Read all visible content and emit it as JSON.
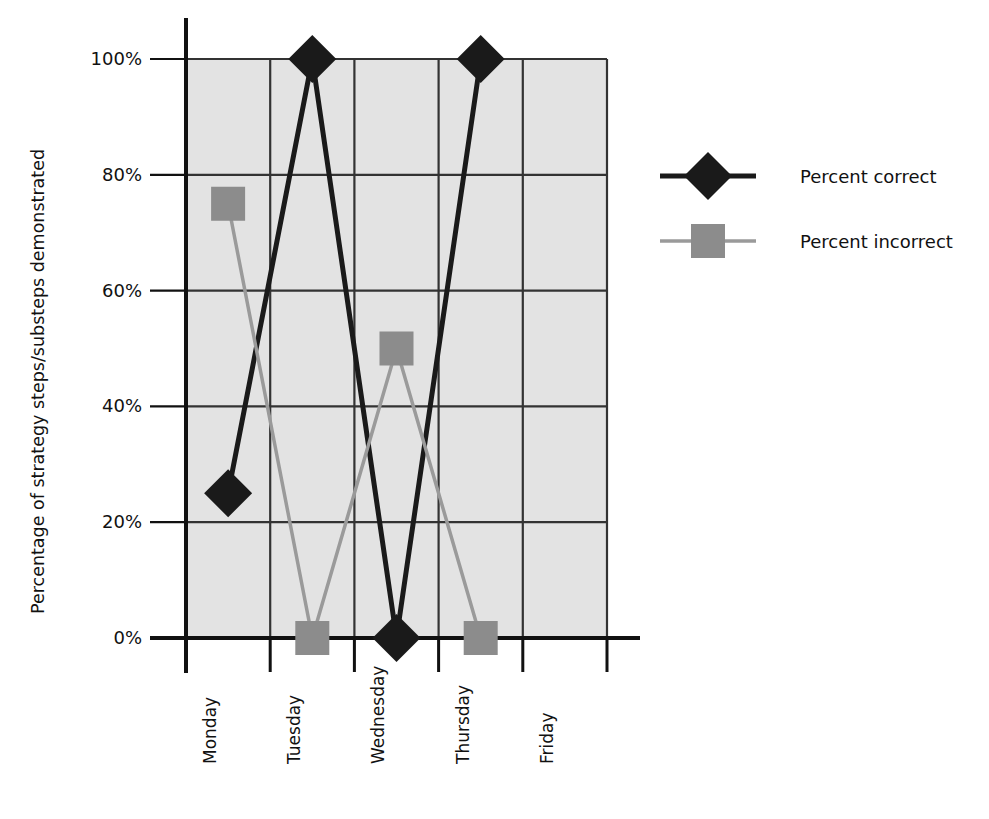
{
  "chart_data": {
    "type": "line",
    "title": "",
    "subtitle": "",
    "xlabel": "",
    "ylabel": "Percentage of strategy steps/substeps demonstrated",
    "categories": [
      "Monday",
      "Tuesday",
      "Wednesday",
      "Thursday",
      "Friday"
    ],
    "ylim": [
      0,
      100
    ],
    "yticks": [
      0,
      20,
      40,
      60,
      80,
      100
    ],
    "ytick_labels": [
      "0%",
      "20%",
      "40%",
      "60%",
      "80%",
      "100%"
    ],
    "grid": true,
    "grid_axes": "both",
    "legend_position": "right",
    "series": [
      {
        "name": "Percent correct",
        "marker": "diamond",
        "color": "#1a1a1a",
        "line_color": "#1a1a1a",
        "values": [
          25,
          100,
          0,
          100,
          null
        ]
      },
      {
        "name": "Percent incorrect",
        "marker": "square",
        "color": "#8c8c8c",
        "line_color": "#9a9a9a",
        "values": [
          75,
          0,
          50,
          0,
          null
        ]
      }
    ],
    "annotations": []
  },
  "axes": {
    "y_axis_title": "Percentage of strategy steps/substeps demonstrated",
    "y_ticks": [
      {
        "value": 100,
        "label": "100%"
      },
      {
        "value": 80,
        "label": "80%"
      },
      {
        "value": 60,
        "label": "60%"
      },
      {
        "value": 40,
        "label": "40%"
      },
      {
        "value": 20,
        "label": "20%"
      },
      {
        "value": 0,
        "label": "0%"
      }
    ],
    "x_ticks": [
      {
        "label": "Monday"
      },
      {
        "label": "Tuesday"
      },
      {
        "label": "Wednesday"
      },
      {
        "label": "Thursday"
      },
      {
        "label": "Friday"
      }
    ]
  },
  "legend": {
    "entries": [
      {
        "label": "Percent correct",
        "marker": "diamond-marker",
        "color": "#1a1a1a"
      },
      {
        "label": "Percent incorrect",
        "marker": "square-marker",
        "color": "#8c8c8c"
      }
    ]
  },
  "colors": {
    "plot_background": "#e3e3e3",
    "grid_line": "#333333",
    "axis_line": "#111111",
    "series_correct": "#1a1a1a",
    "series_incorrect": "#8c8c8c",
    "page_background": "#ffffff",
    "text": "#111111"
  }
}
